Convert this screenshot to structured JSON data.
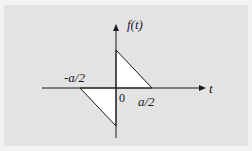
{
  "diagram": {
    "type": "function-plot",
    "y_axis_label": "f(t)",
    "x_axis_label": "t",
    "origin_label": "0",
    "tick_labels": {
      "negative": "-a/2",
      "positive": "a/2"
    },
    "colors": {
      "background": "#e3e3e3",
      "fill": "#ffffff",
      "stroke": "#1a1a1a"
    },
    "shapes": [
      {
        "name": "upper-triangle",
        "points": [
          [
            0,
            1
          ],
          [
            0,
            0
          ],
          [
            "a/2",
            0
          ]
        ]
      },
      {
        "name": "lower-triangle",
        "points": [
          [
            "-a/2",
            0
          ],
          [
            0,
            0
          ],
          [
            0,
            -1
          ]
        ]
      }
    ]
  }
}
